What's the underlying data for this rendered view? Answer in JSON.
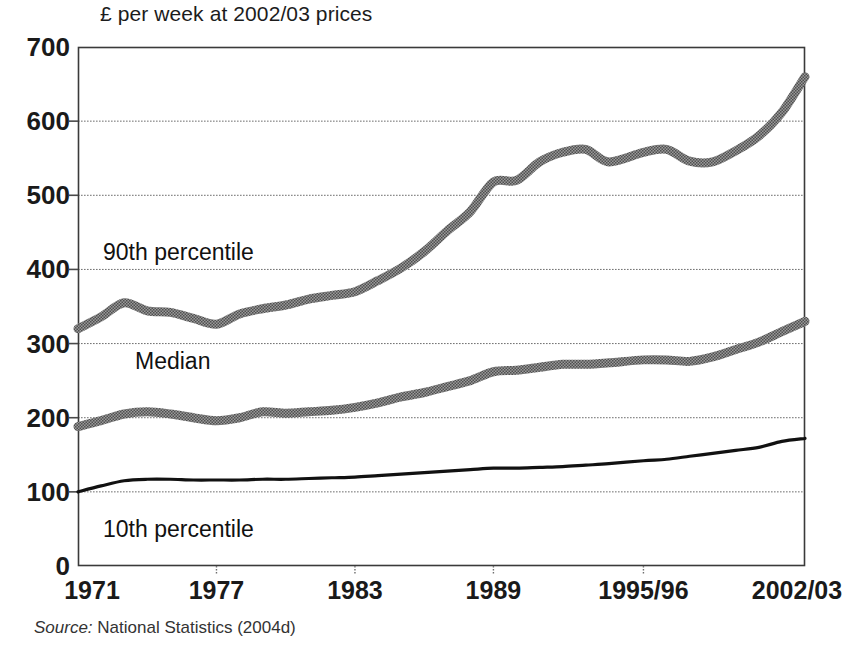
{
  "figure": {
    "axis_title": "£ per week at 2002/03 prices",
    "source_prefix": "Source:",
    "source_text": " National Statistics (2004d)"
  },
  "series_labels": {
    "p90": "90th percentile",
    "median": "Median",
    "p10": "10th percentile"
  },
  "chart_data": {
    "type": "line",
    "title": "£ per week at 2002/03 prices",
    "xlabel": "",
    "ylabel": "£ per week at 2002/03 prices",
    "ylim": [
      0,
      700
    ],
    "yticks": [
      0,
      100,
      200,
      300,
      400,
      500,
      600,
      700
    ],
    "ytick_labels": [
      "0",
      "100",
      "200",
      "300",
      "400",
      "500",
      "600",
      "700"
    ],
    "grid": true,
    "grid_style": "dotted-horizontal",
    "legend_position": "inline-annotations",
    "xtick_labels": [
      "1971",
      "1977",
      "1983",
      "1989",
      "1995/96",
      "2002/03"
    ],
    "xtick_values": [
      1971,
      1977,
      1983,
      1989,
      1995.5,
      2002.5
    ],
    "x": [
      1971,
      1972,
      1973,
      1974,
      1975,
      1976,
      1977,
      1978,
      1979,
      1980,
      1981,
      1982,
      1983,
      1984,
      1985,
      1986,
      1987,
      1988,
      1989,
      1990,
      1991,
      1992,
      1993,
      1994,
      1995.5,
      1996.5,
      1997.5,
      1998.5,
      1999.5,
      2000.5,
      2001.5,
      2002.5
    ],
    "series": [
      {
        "name": "90th percentile",
        "color": "#7d7d7d",
        "style": "thick-textured-band",
        "values": [
          320,
          336,
          355,
          344,
          342,
          334,
          326,
          340,
          347,
          352,
          360,
          365,
          370,
          385,
          402,
          424,
          452,
          478,
          518,
          520,
          545,
          558,
          562,
          545,
          558,
          562,
          546,
          545,
          560,
          580,
          612,
          660
        ]
      },
      {
        "name": "Median",
        "color": "#7d7d7d",
        "style": "thick-textured-band",
        "values": [
          188,
          196,
          205,
          208,
          205,
          200,
          196,
          200,
          208,
          206,
          208,
          210,
          214,
          220,
          228,
          234,
          242,
          250,
          262,
          264,
          268,
          272,
          272,
          274,
          278,
          278,
          276,
          282,
          292,
          302,
          316,
          330
        ]
      },
      {
        "name": "10th percentile",
        "color": "#111111",
        "style": "thin-solid",
        "values": [
          100,
          108,
          115,
          117,
          117,
          116,
          116,
          116,
          117,
          117,
          118,
          119,
          120,
          122,
          124,
          126,
          128,
          130,
          132,
          132,
          133,
          134,
          136,
          138,
          142,
          144,
          148,
          152,
          156,
          160,
          168,
          172
        ]
      }
    ]
  },
  "plot_geometry": {
    "left": 78,
    "right": 805,
    "top": 47,
    "bottom": 566
  }
}
